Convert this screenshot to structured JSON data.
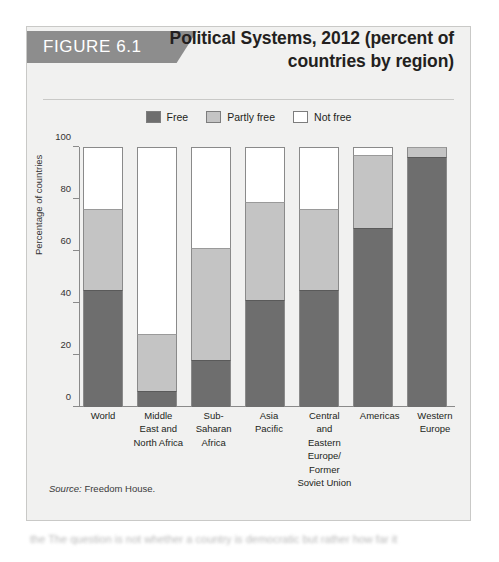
{
  "figure": {
    "badge": "FIGURE 6.1",
    "title": "Political Systems, 2012 (percent of countries by region)",
    "source_prefix": "Source:",
    "source_text": "Freedom House."
  },
  "colors": {
    "free": "#6e6e6e",
    "partly_free": "#c4c4c4",
    "not_free": "#ffffff",
    "badge": "#8d8d8d",
    "card_bg": "#f1f1f0",
    "card_border": "#c9c9c7",
    "axis": "#8a8a8a"
  },
  "page_body_text": "the  The  question  is  not  whether  a  country  is  democratic  but  rather  how  far  it",
  "chart_data": {
    "type": "bar",
    "stacked": true,
    "title": "Political Systems, 2012 (percent of countries by region)",
    "xlabel": "",
    "ylabel": "Percentage of countries",
    "ylim": [
      0,
      100
    ],
    "yticks": [
      0,
      20,
      40,
      60,
      80,
      100
    ],
    "ytick_labels": [
      "0",
      "20",
      "40",
      "60",
      "80",
      "100"
    ],
    "grid": false,
    "legend_position": "top-center",
    "categories": [
      "World",
      "Middle East and North Africa",
      "Sub-Saharan Africa",
      "Asia Pacific",
      "Central and Eastern Europe/ Former Soviet Union",
      "Americas",
      "Western Europe"
    ],
    "category_lines": [
      [
        "World"
      ],
      [
        "Middle",
        "East and",
        "North Africa"
      ],
      [
        "Sub-",
        "Saharan",
        "Africa"
      ],
      [
        "Asia",
        "Pacific"
      ],
      [
        "Central",
        "and",
        "Eastern",
        "Europe/",
        "Former",
        "Soviet Union"
      ],
      [
        "Americas"
      ],
      [
        "Western",
        "Europe"
      ]
    ],
    "series": [
      {
        "name": "Free",
        "color": "#6e6e6e",
        "values": [
          45,
          6,
          18,
          41,
          45,
          69,
          96
        ]
      },
      {
        "name": "Partly free",
        "color": "#c4c4c4",
        "values": [
          31,
          22,
          43,
          38,
          31,
          28,
          4
        ]
      },
      {
        "name": "Not free",
        "color": "#ffffff",
        "values": [
          24,
          72,
          39,
          21,
          24,
          3,
          0
        ]
      }
    ]
  }
}
